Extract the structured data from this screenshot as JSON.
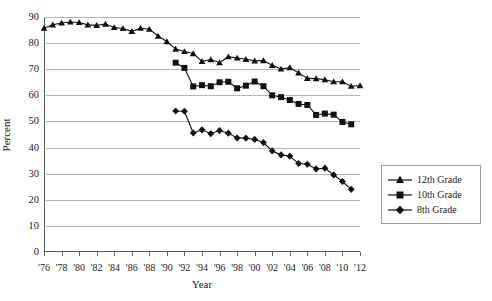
{
  "chart_data": {
    "type": "line",
    "title": "",
    "xlabel": "Year",
    "ylabel": "Percent",
    "xlim": [
      1976,
      2012
    ],
    "ylim": [
      0,
      90
    ],
    "ytick_step": 10,
    "xtick_step": 2,
    "grid": true,
    "legend_position": "right",
    "yticks": [
      "0",
      "10",
      "20",
      "30",
      "40",
      "50",
      "60",
      "70",
      "80",
      "90"
    ],
    "xticks": [
      "'76",
      "'78",
      "'80",
      "'82",
      "'84",
      "'86",
      "'88",
      "'90",
      "'92",
      "'94",
      "'96",
      "'98",
      "'00",
      "'02",
      "'04",
      "'06",
      "'08",
      "'10",
      "'12"
    ],
    "series": [
      {
        "name": "12th Grade",
        "marker": "triangle",
        "color": "#111111",
        "x": [
          1976,
          1977,
          1978,
          1979,
          1980,
          1981,
          1982,
          1983,
          1984,
          1985,
          1986,
          1987,
          1988,
          1989,
          1990,
          1991,
          1992,
          1993,
          1994,
          1995,
          1996,
          1997,
          1998,
          1999,
          2000,
          2001,
          2002,
          2003,
          2004,
          2005,
          2006,
          2007,
          2008,
          2009,
          2010,
          2011,
          2012
        ],
        "values": [
          85.7,
          87.0,
          87.7,
          88.1,
          87.9,
          87.0,
          86.8,
          87.3,
          86.0,
          85.6,
          84.5,
          85.7,
          85.3,
          82.7,
          80.6,
          77.7,
          76.8,
          76.0,
          73.0,
          73.7,
          72.5,
          74.8,
          74.3,
          73.8,
          73.2,
          73.3,
          71.5,
          70.1,
          70.6,
          68.6,
          66.5,
          66.4,
          66.0,
          65.2,
          65.2,
          63.5,
          63.7
        ]
      },
      {
        "name": "10th Grade",
        "marker": "square",
        "color": "#111111",
        "x": [
          1991,
          1992,
          1993,
          1994,
          1995,
          1996,
          1997,
          1998,
          1999,
          2000,
          2001,
          2002,
          2003,
          2004,
          2005,
          2006,
          2007,
          2008,
          2009,
          2010,
          2011,
          2012
        ],
        "values": [
          72.5,
          70.5,
          63.4,
          63.9,
          63.5,
          65.0,
          65.2,
          62.7,
          63.7,
          65.3,
          63.5,
          60.0,
          59.3,
          58.2,
          56.7,
          56.3,
          52.5,
          53.0,
          52.6,
          49.8,
          48.9,
          null
        ]
      },
      {
        "name": "8th Grade",
        "marker": "diamond",
        "color": "#111111",
        "x": [
          1991,
          1992,
          1993,
          1994,
          1995,
          1996,
          1997,
          1998,
          1999,
          2000,
          2001,
          2002,
          2003,
          2004,
          2005,
          2006,
          2007,
          2008,
          2009,
          2010,
          2011,
          2012
        ],
        "values": [
          54.0,
          53.9,
          45.6,
          46.8,
          45.3,
          46.5,
          45.5,
          43.7,
          43.6,
          43.1,
          41.9,
          38.7,
          37.2,
          36.7,
          33.9,
          33.6,
          31.8,
          32.1,
          29.5,
          27.0,
          24.0,
          null
        ]
      }
    ]
  },
  "legend": {
    "items": [
      {
        "label": "12th Grade",
        "marker": "triangle"
      },
      {
        "label": "10th Grade",
        "marker": "square"
      },
      {
        "label": "8th Grade",
        "marker": "diamond"
      }
    ]
  }
}
